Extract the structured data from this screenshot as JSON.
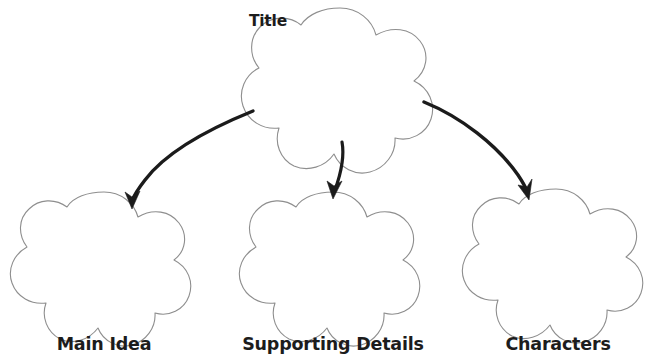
{
  "diagram": {
    "type": "graphic-organizer",
    "background_color": "#ffffff",
    "outline_color": "#8e8e8e",
    "arrow_color": "#1b1b1b",
    "text_color": "#1c1c1c",
    "nodes": [
      {
        "id": "title",
        "label": "Title",
        "shape": "five-lobed-rounded-star",
        "label_position": "top-left-outside",
        "center_x": 340,
        "center_y": 78,
        "radius": 72
      },
      {
        "id": "main-idea",
        "label": "Main Idea",
        "shape": "five-lobed-rounded-star",
        "label_position": "below",
        "center_x": 104,
        "center_y": 262,
        "radius": 66
      },
      {
        "id": "supporting-details",
        "label": "Supporting Details",
        "shape": "five-lobed-rounded-star",
        "label_position": "below",
        "center_x": 333,
        "center_y": 262,
        "radius": 66
      },
      {
        "id": "characters",
        "label": "Characters",
        "shape": "five-lobed-rounded-star",
        "label_position": "below",
        "center_x": 556,
        "center_y": 259,
        "radius": 66
      }
    ],
    "arrows": [
      {
        "id": "arrow-title-to-main-idea",
        "from": "title",
        "to": "main-idea",
        "direction": "down-left",
        "curved": true
      },
      {
        "id": "arrow-title-to-supporting-details",
        "from": "title",
        "to": "supporting-details",
        "direction": "down",
        "curved": true
      },
      {
        "id": "arrow-title-to-characters",
        "from": "title",
        "to": "characters",
        "direction": "down-right",
        "curved": true
      }
    ]
  }
}
